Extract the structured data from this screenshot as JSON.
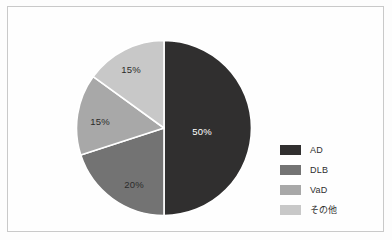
{
  "chart_data": {
    "type": "pie",
    "title": "",
    "subtitle": "",
    "xlabel": "",
    "ylabel": "",
    "legend_position": "right",
    "grid": false,
    "categories": [
      "AD",
      "DLB",
      "VaD",
      "その他"
    ],
    "values": [
      50,
      20,
      15,
      15
    ],
    "data_labels": [
      "50%",
      "20%",
      "15%",
      "15%"
    ],
    "colors": [
      "#302f2f",
      "#737373",
      "#a8a8a8",
      "#c8c8c8"
    ],
    "label_colors": [
      "#ffffff",
      "#2b2b2b",
      "#2b2b2b",
      "#2b2b2b"
    ],
    "slice_separator_color": "#ffffff",
    "start_angle_deg": 0,
    "direction": "clockwise",
    "slices": [
      {
        "name": "AD",
        "value": 50,
        "label": "50%",
        "color": "#302f2f",
        "label_color": "#ffffff",
        "label_x": 126,
        "label_y": 92
      },
      {
        "name": "DLB",
        "value": 20,
        "label": "20%",
        "color": "#737373",
        "label_color": "#2b2b2b",
        "label_x": 58,
        "label_y": 145
      },
      {
        "name": "VaD",
        "value": 15,
        "label": "15%",
        "color": "#a8a8a8",
        "label_color": "#2b2b2b",
        "label_x": 24,
        "label_y": 82
      },
      {
        "name": "その他",
        "value": 15,
        "label": "15%",
        "color": "#c8c8c8",
        "label_color": "#2b2b2b",
        "label_x": 55,
        "label_y": 30
      }
    ]
  },
  "legend": {
    "items": [
      {
        "label": "AD",
        "color": "#302f2f"
      },
      {
        "label": "DLB",
        "color": "#737373"
      },
      {
        "label": "VaD",
        "color": "#a8a8a8"
      },
      {
        "label": "その他",
        "color": "#c8c8c8"
      }
    ]
  },
  "figure": {
    "background_color": "#fefefe",
    "border_color": "#c9c9c9"
  }
}
